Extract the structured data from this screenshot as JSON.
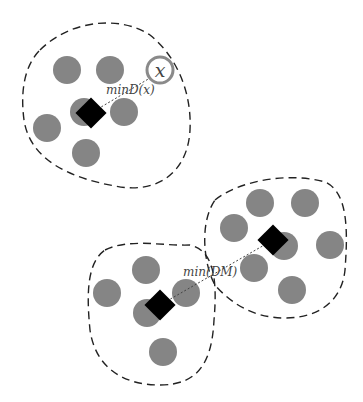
{
  "diagram": {
    "type": "clustering-distance-illustration",
    "colors": {
      "point": "#858585",
      "centroid": "#000000",
      "boundary": "#222222",
      "query_ring": "#8a8a8a",
      "link": "#444444"
    },
    "labels": {
      "query_point": "x",
      "min_distance_point": "minD(x)",
      "min_distance_clusters": "min(DM)"
    },
    "clusters": [
      {
        "name": "top-left",
        "point_count": 6,
        "has_centroid": true
      },
      {
        "name": "bottom-left",
        "point_count": 5,
        "has_centroid": true
      },
      {
        "name": "bottom-right",
        "point_count": 7,
        "has_centroid": true
      }
    ]
  }
}
